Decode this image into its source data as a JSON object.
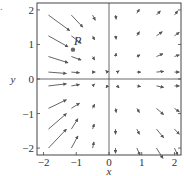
{
  "figure_label": ".",
  "chart_data": {
    "type": "vector_field",
    "title": "",
    "xlabel": "x",
    "ylabel": "y",
    "xlim": [
      -2.2,
      2.2
    ],
    "ylim": [
      -2.2,
      2.2
    ],
    "x_ticks": [
      -2,
      -1,
      0,
      1,
      2
    ],
    "y_ticks": [
      -2,
      -1,
      0,
      1,
      2
    ],
    "x_tick_labels": [
      "−2",
      "−1",
      "0",
      "1",
      "2"
    ],
    "y_tick_labels": [
      "−2",
      "−1",
      "0",
      "1",
      "2"
    ],
    "grid": false,
    "point": {
      "label": "P",
      "x": -1.1,
      "y": 0.85
    },
    "arrows": [
      {
        "x": -1.85,
        "y": 1.85,
        "dx": 0.65,
        "dy": -0.45
      },
      {
        "x": -1.15,
        "y": 1.85,
        "dx": 0.35,
        "dy": -0.35
      },
      {
        "x": -0.5,
        "y": 1.85,
        "dx": 0.08,
        "dy": -0.15
      },
      {
        "x": 0.2,
        "y": 1.85,
        "dx": 0.02,
        "dy": -0.12
      },
      {
        "x": 0.85,
        "y": 1.9,
        "dx": 0.08,
        "dy": 0.12
      },
      {
        "x": 1.45,
        "y": 1.85,
        "dx": 0.12,
        "dy": 0.12
      },
      {
        "x": 2.0,
        "y": 1.85,
        "dx": 0.1,
        "dy": 0.12
      },
      {
        "x": -1.85,
        "y": 1.25,
        "dx": 0.6,
        "dy": -0.32
      },
      {
        "x": -1.15,
        "y": 1.25,
        "dx": 0.3,
        "dy": -0.22
      },
      {
        "x": -0.5,
        "y": 1.25,
        "dx": 0.06,
        "dy": -0.12
      },
      {
        "x": 0.2,
        "y": 1.25,
        "dx": 0.02,
        "dy": -0.1
      },
      {
        "x": 0.85,
        "y": 1.25,
        "dx": 0.08,
        "dy": 0.12
      },
      {
        "x": 1.45,
        "y": 1.25,
        "dx": 0.18,
        "dy": 0.12
      },
      {
        "x": 2.0,
        "y": 1.25,
        "dx": 0.15,
        "dy": 0.1
      },
      {
        "x": -1.85,
        "y": 0.65,
        "dx": 0.6,
        "dy": -0.18
      },
      {
        "x": -1.15,
        "y": 0.65,
        "dx": 0.3,
        "dy": -0.1
      },
      {
        "x": -0.5,
        "y": 0.65,
        "dx": 0.06,
        "dy": -0.1
      },
      {
        "x": 0.2,
        "y": 0.65,
        "dx": 0.02,
        "dy": 0.1
      },
      {
        "x": 0.85,
        "y": 0.65,
        "dx": 0.1,
        "dy": 0.05
      },
      {
        "x": 1.45,
        "y": 0.65,
        "dx": 0.2,
        "dy": 0.08
      },
      {
        "x": 2.0,
        "y": 0.65,
        "dx": 0.15,
        "dy": 0.05
      },
      {
        "x": -1.85,
        "y": 0.2,
        "dx": 0.55,
        "dy": -0.04
      },
      {
        "x": -1.15,
        "y": 0.2,
        "dx": 0.25,
        "dy": -0.02
      },
      {
        "x": -0.5,
        "y": 0.2,
        "dx": 0.08,
        "dy": 0.0
      },
      {
        "x": -0.05,
        "y": 0.2,
        "dx": -0.05,
        "dy": 0.05
      },
      {
        "x": 0.25,
        "y": 0.2,
        "dx": 0.06,
        "dy": 0.04
      },
      {
        "x": 0.85,
        "y": 0.2,
        "dx": 0.12,
        "dy": 0.0
      },
      {
        "x": 1.45,
        "y": 0.2,
        "dx": 0.22,
        "dy": 0.02
      },
      {
        "x": 2.0,
        "y": 0.2,
        "dx": 0.15,
        "dy": 0.0
      },
      {
        "x": -1.85,
        "y": -0.2,
        "dx": 0.55,
        "dy": 0.06
      },
      {
        "x": -1.15,
        "y": -0.2,
        "dx": 0.25,
        "dy": 0.04
      },
      {
        "x": -0.5,
        "y": -0.2,
        "dx": 0.06,
        "dy": 0.06
      },
      {
        "x": -0.05,
        "y": -0.2,
        "dx": -0.04,
        "dy": -0.06
      },
      {
        "x": 0.25,
        "y": -0.2,
        "dx": 0.06,
        "dy": -0.06
      },
      {
        "x": 0.85,
        "y": -0.2,
        "dx": 0.12,
        "dy": -0.02
      },
      {
        "x": 1.45,
        "y": -0.2,
        "dx": 0.22,
        "dy": -0.04
      },
      {
        "x": 2.0,
        "y": -0.2,
        "dx": 0.15,
        "dy": 0.0
      },
      {
        "x": -1.85,
        "y": -0.85,
        "dx": 0.55,
        "dy": 0.25
      },
      {
        "x": -1.15,
        "y": -0.85,
        "dx": 0.25,
        "dy": 0.15
      },
      {
        "x": -0.5,
        "y": -0.85,
        "dx": 0.06,
        "dy": 0.12
      },
      {
        "x": 0.2,
        "y": -0.85,
        "dx": 0.02,
        "dy": -0.12
      },
      {
        "x": 0.85,
        "y": -0.85,
        "dx": 0.08,
        "dy": -0.12
      },
      {
        "x": 1.45,
        "y": -0.85,
        "dx": 0.22,
        "dy": -0.18
      },
      {
        "x": 2.0,
        "y": -0.85,
        "dx": 0.15,
        "dy": -0.1
      },
      {
        "x": -1.85,
        "y": -1.45,
        "dx": 0.55,
        "dy": 0.45
      },
      {
        "x": -1.15,
        "y": -1.45,
        "dx": 0.2,
        "dy": 0.3
      },
      {
        "x": -0.5,
        "y": -1.45,
        "dx": 0.05,
        "dy": 0.15
      },
      {
        "x": 0.2,
        "y": -1.45,
        "dx": 0.0,
        "dy": -0.15
      },
      {
        "x": 0.85,
        "y": -1.45,
        "dx": 0.08,
        "dy": -0.15
      },
      {
        "x": 1.45,
        "y": -1.45,
        "dx": 0.22,
        "dy": -0.25
      },
      {
        "x": 2.0,
        "y": -1.45,
        "dx": 0.15,
        "dy": -0.15
      },
      {
        "x": -1.85,
        "y": -2.0,
        "dx": 0.55,
        "dy": 0.55
      },
      {
        "x": -1.15,
        "y": -2.0,
        "dx": 0.2,
        "dy": 0.35
      },
      {
        "x": -0.5,
        "y": -2.0,
        "dx": 0.04,
        "dy": 0.18
      },
      {
        "x": 0.2,
        "y": -2.0,
        "dx": 0.0,
        "dy": -0.15
      },
      {
        "x": 0.85,
        "y": -2.0,
        "dx": 0.1,
        "dy": -0.2
      },
      {
        "x": 1.45,
        "y": -2.0,
        "dx": 0.2,
        "dy": -0.3
      },
      {
        "x": 2.0,
        "y": -2.0,
        "dx": 0.1,
        "dy": -0.2
      }
    ]
  },
  "colors": {
    "arrow": "#555555",
    "axis": "#444444",
    "frame": "#444444",
    "point": "#666666",
    "text": "#333333"
  }
}
